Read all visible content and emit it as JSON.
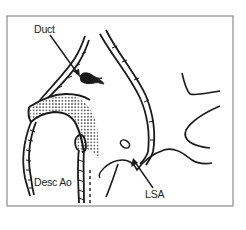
{
  "diagram": {
    "type": "anatomical-line-drawing",
    "frame": {
      "stroke": "#8a8a8a",
      "fill": "#ffffff"
    },
    "ink": "#1a1a1a",
    "labels": {
      "duct": "Duct",
      "desc_ao": "Desc Ao",
      "lsa": "LSA"
    },
    "annotations": [
      {
        "id": "duct",
        "text": "Duct",
        "arrow_target": "ductus-arteriosus (black shape)"
      },
      {
        "id": "desc_ao",
        "text": "Desc Ao",
        "arrow_target": null
      },
      {
        "id": "lsa",
        "text": "LSA",
        "arrow_target": "left subclavian artery origin"
      }
    ]
  }
}
